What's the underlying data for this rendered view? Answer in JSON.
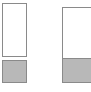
{
  "figure": {
    "background_color": "#ffffff",
    "width": 91,
    "height": 92
  },
  "style": {
    "outline_color": "#8a8a8a",
    "fill_color": "#b8b8b8",
    "empty_color": "#ffffff",
    "border_width": 1
  },
  "chart_data": {
    "type": "bar",
    "xlabel": "",
    "ylabel": "",
    "grid": false,
    "legend": "none",
    "orientation": "vertical",
    "categories": [
      "Left",
      "Right"
    ],
    "values": [
      30,
      32
    ],
    "ylim": [
      0,
      100
    ],
    "series": [
      {
        "name": "Filled",
        "values": [
          30,
          32
        ],
        "color": "#b8b8b8"
      },
      {
        "name": "Empty",
        "values": [
          70,
          68
        ],
        "color": "#ffffff"
      }
    ],
    "annotations": []
  },
  "bars": {
    "left": {
      "label": "Left bar",
      "empty_segment_label": "Left empty segment",
      "filled_segment_label": "Left filled segment",
      "fill_percent": 30,
      "detached": true
    },
    "right": {
      "label": "Right bar",
      "empty_segment_label": "Right empty segment",
      "filled_segment_label": "Right filled segment",
      "fill_percent": 32,
      "detached": false
    }
  }
}
